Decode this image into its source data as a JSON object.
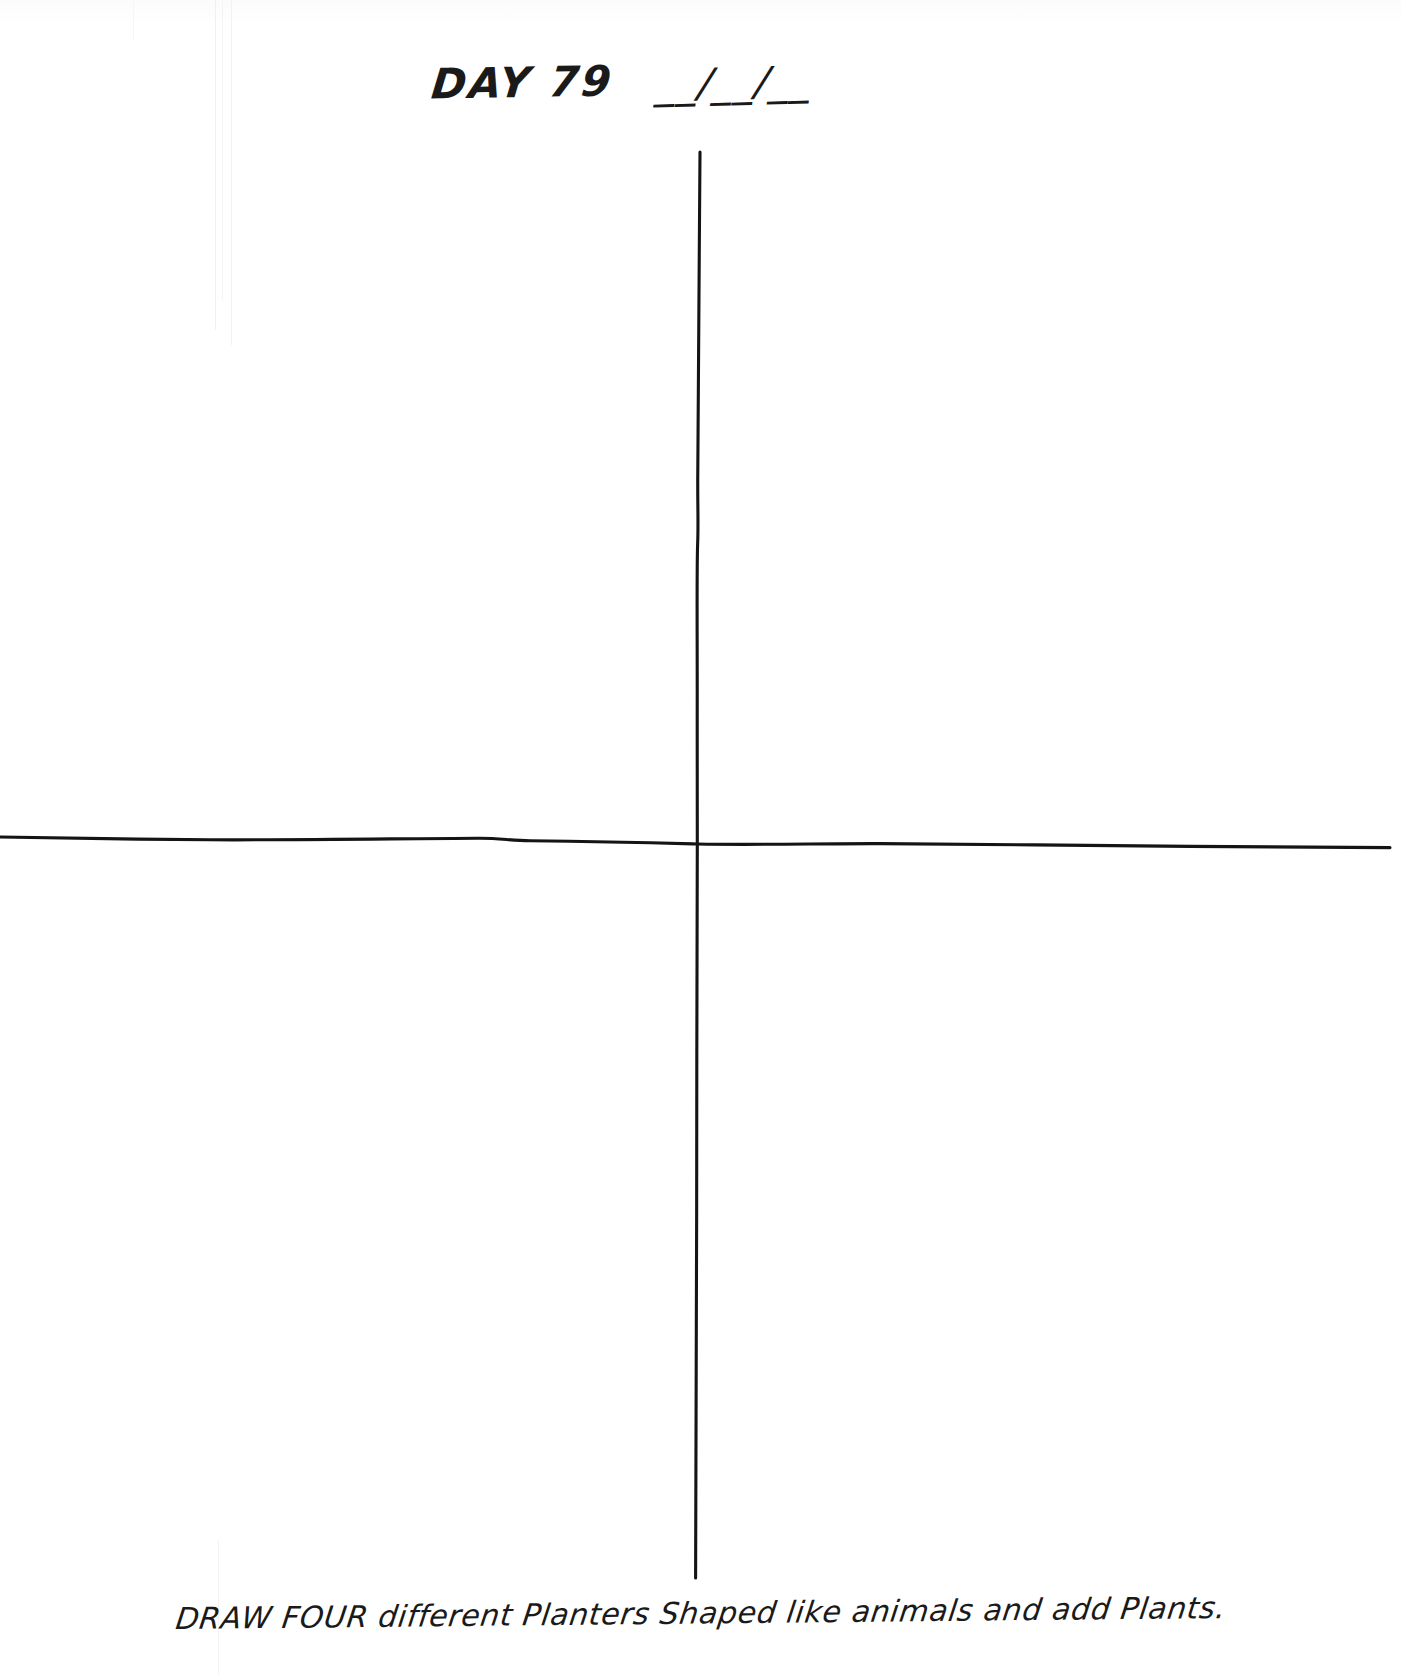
{
  "page": {
    "background_color": "#ffffff",
    "ink_color": "#141414"
  },
  "header": {
    "day_label": "DAY 79",
    "date_blank": "__/__/__"
  },
  "worksheet": {
    "grid_type": "four-quadrant cross",
    "quadrants": [
      {
        "name": "top-left",
        "content": ""
      },
      {
        "name": "top-right",
        "content": ""
      },
      {
        "name": "bottom-left",
        "content": ""
      },
      {
        "name": "bottom-right",
        "content": ""
      }
    ]
  },
  "caption": {
    "text": "DRAW FOUR different Planters Shaped like animals and add Plants."
  }
}
